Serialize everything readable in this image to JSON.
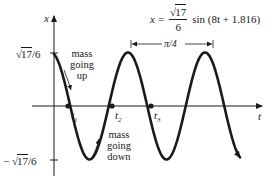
{
  "chart_data": {
    "type": "line",
    "xlabel": "t",
    "ylabel": "x",
    "function": {
      "amplitude_label": "√17/6",
      "amplitude": 0.687,
      "angular_frequency": 8,
      "phase": 1.816
    },
    "y_ticks": [
      "√17/6",
      "− √17/6"
    ],
    "x_marks": [
      "t1",
      "t2",
      "t3"
    ],
    "period_annotation": "π/4",
    "annotations": [
      "mass going up",
      "mass going down"
    ],
    "grid": false,
    "legend": null
  },
  "equation": {
    "lhs": "x",
    "equals": "=",
    "sqrt_arg": "17",
    "denominator": "6",
    "rest": "sin (8t + 1.816)"
  },
  "axes": {
    "y_label": "x",
    "x_label": "t",
    "y_top_tick_sqrt": "17",
    "y_top_tick_rest": "/6",
    "y_bottom_tick_sign": "−",
    "y_bottom_tick_sqrt": "17",
    "y_bottom_tick_rest": "/6"
  },
  "marks": {
    "t1": "t",
    "t1_sub": "1",
    "t2": "t",
    "t2_sub": "2",
    "t3": "t",
    "t3_sub": "3"
  },
  "period": {
    "label": "π/4"
  },
  "notes": {
    "up": [
      "mass",
      "going",
      "up"
    ],
    "down": [
      "mass",
      "going",
      "down"
    ]
  },
  "caption": ""
}
